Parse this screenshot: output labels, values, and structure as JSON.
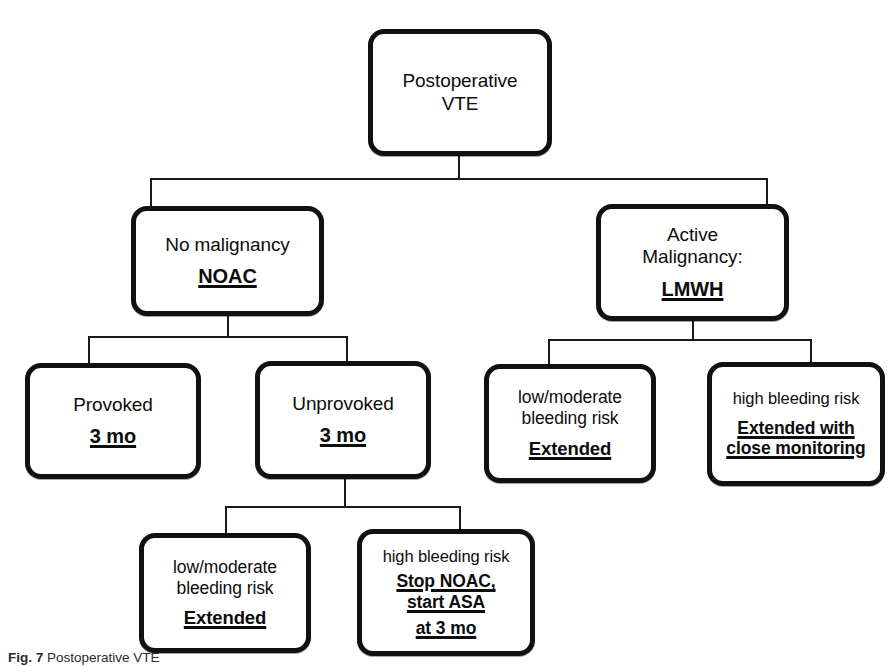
{
  "figure": {
    "caption_label": "Fig. 7",
    "caption_text": "Postoperative VTE",
    "type": "clinical-decision-tree",
    "background_color": "#ffffff",
    "line_color": "#111111",
    "text_color": "#0d0d0d"
  },
  "nodes": {
    "root": {
      "id": "postoperative-vte",
      "line1": "Postoperative",
      "line2": "VTE"
    },
    "no_malignancy": {
      "id": "no-malignancy",
      "line1": "No malignancy",
      "emphasis1": "NOAC"
    },
    "active_malignancy": {
      "id": "active-malignancy",
      "line1": "Active",
      "line2": "Malignancy:",
      "emphasis1": "LMWH"
    },
    "provoked": {
      "id": "provoked",
      "line1": "Provoked",
      "emphasis1": "3 mo"
    },
    "unprovoked": {
      "id": "unprovoked",
      "line1": "Unprovoked",
      "emphasis1": "3 mo"
    },
    "malignancy_low_risk": {
      "id": "malignancy-low-moderate-bleeding-risk",
      "line1": "low/moderate",
      "line2": "bleeding risk",
      "emphasis1": "Extended"
    },
    "malignancy_high_risk": {
      "id": "malignancy-high-bleeding-risk",
      "line1": "high bleeding risk",
      "emphasis1": "Extended with",
      "emphasis2": "close monitoring"
    },
    "unprovoked_low_risk": {
      "id": "unprovoked-low-moderate-bleeding-risk",
      "line1": "low/moderate",
      "line2": "bleeding risk",
      "emphasis1": "Extended"
    },
    "unprovoked_high_risk": {
      "id": "unprovoked-high-bleeding-risk",
      "line1": "high bleeding risk",
      "emphasis1": "Stop NOAC,",
      "emphasis2": "start ASA",
      "emphasis3": "at 3 mo"
    }
  },
  "edges": [
    {
      "from": "postoperative-vte",
      "to": "no-malignancy"
    },
    {
      "from": "postoperative-vte",
      "to": "active-malignancy"
    },
    {
      "from": "no-malignancy",
      "to": "provoked"
    },
    {
      "from": "no-malignancy",
      "to": "unprovoked"
    },
    {
      "from": "active-malignancy",
      "to": "malignancy-low-moderate-bleeding-risk"
    },
    {
      "from": "active-malignancy",
      "to": "malignancy-high-bleeding-risk"
    },
    {
      "from": "unprovoked",
      "to": "unprovoked-low-moderate-bleeding-risk"
    },
    {
      "from": "unprovoked",
      "to": "unprovoked-high-bleeding-risk"
    }
  ]
}
